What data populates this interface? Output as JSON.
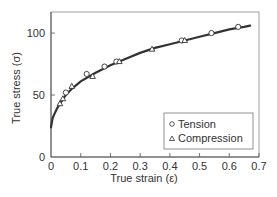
{
  "chart_data": {
    "type": "scatter",
    "title": "",
    "xlabel": "True strain (ε)",
    "ylabel": "True stress (σ)",
    "xlim": [
      0,
      0.7
    ],
    "ylim": [
      0,
      117
    ],
    "xticks": [
      0,
      0.1,
      0.2,
      0.3,
      0.4,
      0.5,
      0.6,
      0.7
    ],
    "xtick_labels": [
      "0",
      "0.1",
      "0.2",
      "0.3",
      "0.4",
      "0.5",
      "0.6",
      "0.7"
    ],
    "yticks": [
      0,
      50,
      100
    ],
    "ytick_labels": [
      "0",
      "50",
      "100"
    ],
    "grid": false,
    "legend_position": "lower right",
    "series": [
      {
        "name": "Tension",
        "marker": "circle",
        "x": [
          0.05,
          0.12,
          0.18,
          0.22,
          0.44,
          0.54,
          0.63
        ],
        "y": [
          52,
          67,
          73,
          77,
          94,
          100,
          105
        ]
      },
      {
        "name": "Compression",
        "marker": "triangle",
        "x": [
          0.03,
          0.04,
          0.07,
          0.14,
          0.23,
          0.34,
          0.45
        ],
        "y": [
          43,
          47,
          57,
          65,
          77,
          87,
          94
        ]
      },
      {
        "name": "Fit curve",
        "marker": "line",
        "x": [
          0,
          0.005,
          0.01,
          0.02,
          0.03,
          0.05,
          0.07,
          0.1,
          0.15,
          0.2,
          0.25,
          0.3,
          0.35,
          0.4,
          0.45,
          0.5,
          0.55,
          0.6,
          0.65,
          0.67
        ],
        "y": [
          24,
          31,
          34,
          39,
          43,
          50,
          55,
          61,
          68,
          74,
          79,
          84,
          88,
          91,
          94,
          97,
          100,
          103,
          105,
          106
        ]
      }
    ],
    "legend": [
      {
        "symbol": "○",
        "label": "Tension"
      },
      {
        "symbol": "△",
        "label": "Compression"
      }
    ]
  }
}
